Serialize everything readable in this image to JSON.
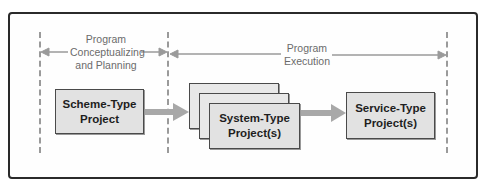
{
  "diagram": {
    "phases": [
      {
        "id": "planning",
        "label_lines": [
          "Program",
          "Conceptualizing",
          "and Planning"
        ]
      },
      {
        "id": "execution",
        "label_lines": [
          "Program",
          "Execution"
        ]
      }
    ],
    "nodes": [
      {
        "id": "scheme",
        "label_lines": [
          "Scheme-Type",
          "Project"
        ]
      },
      {
        "id": "system",
        "label_lines": [
          "System-Type",
          "Project(s)"
        ],
        "stacked_copies": 3
      },
      {
        "id": "service",
        "label_lines": [
          "Service-Type",
          "Project(s)"
        ]
      }
    ],
    "edges": [
      {
        "from": "scheme",
        "to": "system"
      },
      {
        "from": "system",
        "to": "service"
      }
    ],
    "colors": {
      "frame_border": "#2a2a2a",
      "box_fill": "#e2e2e2",
      "box_border": "#4a4a4a",
      "arrow_gray": "#a8a8a8",
      "phase_arrow": "#9a9a9a",
      "phase_text": "#6b6b6b"
    }
  }
}
